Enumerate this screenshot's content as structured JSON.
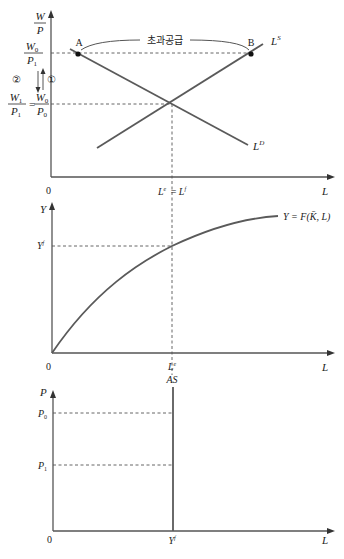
{
  "panel_top": {
    "y_axis_label_num": "W",
    "y_axis_label_den": "P",
    "x_axis_label": "L",
    "origin": "0",
    "tick_high_num": "W",
    "tick_high_num_sub": "0",
    "tick_high_den": "P",
    "tick_high_den_sub": "1",
    "tick_low_left_num": "W",
    "tick_low_left_num_sub": "1",
    "tick_low_left_den": "P",
    "tick_low_left_den_sub": "1",
    "tick_low_eq": "=",
    "tick_low_right_num": "W",
    "tick_low_right_num_sub": "0",
    "tick_low_right_den": "P",
    "tick_low_right_den_sub": "0",
    "arrow_down_label": "②",
    "arrow_up_label": "①",
    "point_a": "A",
    "point_b": "B",
    "excess_supply_label": "초과공급",
    "supply_curve_label": "L",
    "supply_curve_sup": "S",
    "demand_curve_label": "L",
    "demand_curve_sup": "D",
    "x_tick_label_left": "L",
    "x_tick_label_left_sup": "e",
    "x_tick_label_eq": "=",
    "x_tick_label_right": "L",
    "x_tick_label_right_sup": "f"
  },
  "panel_middle": {
    "y_axis_label": "Y",
    "x_axis_label": "L",
    "origin": "0",
    "y_tick": "Y",
    "y_tick_sup": "f",
    "x_tick": "L",
    "x_tick_sup": "e",
    "curve_label": "Y = F(K̄, L)"
  },
  "panel_bottom": {
    "y_axis_label": "P",
    "x_axis_label": "L",
    "origin": "0",
    "as_label": "AS",
    "p0_label": "P",
    "p0_sub": "0",
    "p1_label": "P",
    "p1_sub": "1",
    "x_tick": "Y",
    "x_tick_sup": "f"
  },
  "colors": {
    "line": "#5a5a5a",
    "text": "#222222",
    "background": "#ffffff"
  }
}
